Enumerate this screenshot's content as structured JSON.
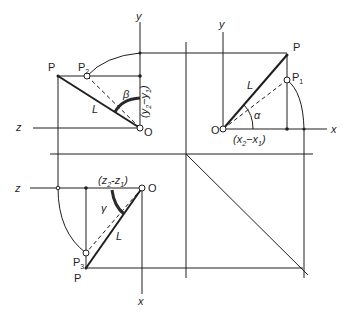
{
  "figure": {
    "colors": {
      "ink": "#1f1f1f",
      "background": "#ffffff"
    }
  },
  "views": {
    "side_view": {
      "axis_vertical": "y",
      "axis_horizontal": "z",
      "origin": "O",
      "point_true": "P",
      "point_rotated": "P",
      "point_rotated_sub": "2",
      "length": "L",
      "angle": "β",
      "dimension": {
        "open": "(",
        "a": "y",
        "a_sub": "2",
        "minus": "−",
        "b": "y",
        "b_sub": "1",
        "close": ")"
      }
    },
    "front_view": {
      "axis_vertical": "y",
      "axis_horizontal": "x",
      "origin": "O",
      "point_true": "P",
      "point_rotated": "P",
      "point_rotated_sub": "1",
      "length": "L",
      "angle": "α",
      "dimension": {
        "open": "(",
        "a": "x",
        "a_sub": "2",
        "minus": "−",
        "b": "x",
        "b_sub": "1",
        "close": ")"
      }
    },
    "top_view": {
      "axis_vertical": "x",
      "axis_horizontal": "z",
      "origin": "O",
      "point_true": "P",
      "point_rotated": "P",
      "point_rotated_sub": "3",
      "length": "L",
      "angle": "γ",
      "dimension": {
        "open": "(",
        "a": "z",
        "a_sub": "2",
        "minus": "-",
        "b": "z",
        "b_sub": "1",
        "close": ")"
      }
    }
  }
}
